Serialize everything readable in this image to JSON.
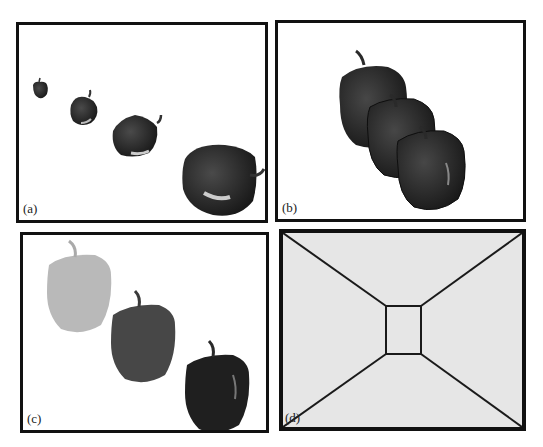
{
  "figure": {
    "panels": [
      {
        "id": "a",
        "label": "(a)",
        "description": "Four bell peppers of increasing size receding diagonally"
      },
      {
        "id": "b",
        "label": "(b)",
        "description": "Three overlapping bell peppers"
      },
      {
        "id": "c",
        "label": "(c)",
        "description": "Three bell peppers in light, medium and dark shading"
      },
      {
        "id": "d",
        "label": "(d)",
        "description": "Perspective line drawing of a corridor with central square"
      }
    ]
  }
}
